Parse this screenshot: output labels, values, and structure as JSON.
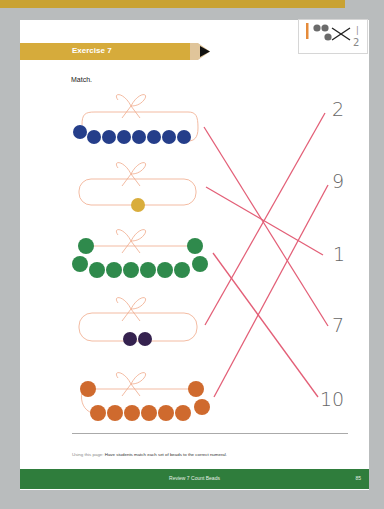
{
  "header": {
    "exercise_title": "Exercise 7",
    "instruction": "Match."
  },
  "icon_box": {
    "icon": "match-activity-icon",
    "numerals": [
      "1",
      "2"
    ]
  },
  "bead_sets": [
    {
      "color": "#253e8a",
      "count": 7,
      "layout": "single-row"
    },
    {
      "color": "#d9ad3c",
      "count": 1,
      "layout": "single"
    },
    {
      "color": "#2f8a4c",
      "count": 10,
      "layout": "loop"
    },
    {
      "color": "#35224f",
      "count": 2,
      "layout": "pair"
    },
    {
      "color": "#cf6a2e",
      "count": 10,
      "layout": "loop"
    }
  ],
  "numerals": [
    {
      "label": "2"
    },
    {
      "label": "9"
    },
    {
      "label": "1"
    },
    {
      "label": "7"
    },
    {
      "label": "10"
    }
  ],
  "matches": [
    {
      "from_set": 0,
      "to_numeral": "7"
    },
    {
      "from_set": 1,
      "to_numeral": "1"
    },
    {
      "from_set": 2,
      "to_numeral": "10"
    },
    {
      "from_set": 3,
      "to_numeral": "2"
    },
    {
      "from_set": 4,
      "to_numeral": "9"
    }
  ],
  "teacher_note": {
    "lead": "Using this page:",
    "text": "Have students match each set of beads to the correct numeral."
  },
  "footer": {
    "title": "Review 7  Count Beads",
    "page_number": "85"
  },
  "colors": {
    "banner_gold": "#d6ab3b",
    "footer_green": "#2f7d3c",
    "match_line": "#e35f77",
    "string": "#f0a98a"
  }
}
